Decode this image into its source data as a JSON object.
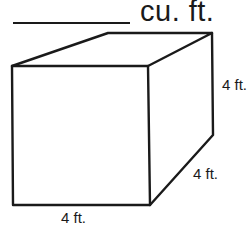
{
  "problem": {
    "answer_blank": "",
    "unit": "cu. ft."
  },
  "figure": {
    "shape": "rectangular prism",
    "dimensions": {
      "height": "4 ft.",
      "depth": "4 ft.",
      "width": "4 ft."
    }
  }
}
